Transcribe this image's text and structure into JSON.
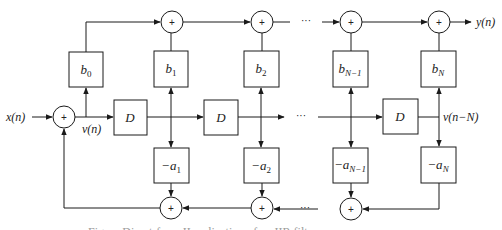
{
  "diagram": {
    "type": "signal-flow block diagram",
    "input_label": "x(n)",
    "output_label": "y(n)",
    "state_label": "v(n)",
    "last_state_label": "v(n−N)",
    "delay_label": "D",
    "adder_symbol": "+",
    "ellipsis": "···",
    "feedforward_coeffs": [
      {
        "base": "b",
        "sub": "0"
      },
      {
        "base": "b",
        "sub": "1"
      },
      {
        "base": "b",
        "sub": "2"
      },
      {
        "base": "b",
        "sub": "N−1"
      },
      {
        "base": "b",
        "sub": "N"
      }
    ],
    "feedback_coeffs": [
      {
        "base": "−a",
        "sub": "1"
      },
      {
        "base": "−a",
        "sub": "2"
      },
      {
        "base": "−a",
        "sub": "N−1"
      },
      {
        "base": "−a",
        "sub": "N"
      }
    ],
    "caption": "Figure  Direct-form II realization of an IIR filter"
  },
  "colors": {
    "stroke": "#1a1a1a",
    "background": "#ffffff",
    "caption": "#9a9a9a"
  }
}
